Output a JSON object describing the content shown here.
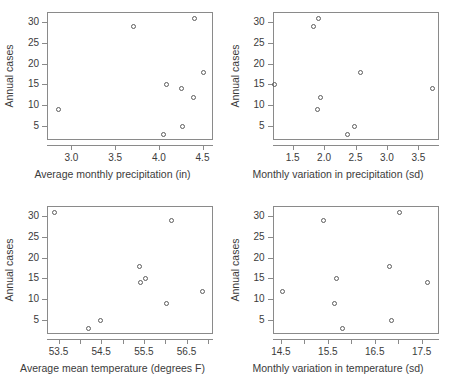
{
  "figure": {
    "ylabel": "Annual cases",
    "n_panels": 4,
    "marker": "open-circle",
    "marker_color": "#5c5c5c",
    "frame_color": "#8a8a8a",
    "background": "#ffffff"
  },
  "chart_data": [
    {
      "type": "scatter",
      "title": "",
      "xlabel": "Average monthly precipitation (in)",
      "ylabel": "Annual cases",
      "xlim": [
        2.72,
        4.62
      ],
      "ylim": [
        1.6,
        32.4
      ],
      "xticks": [
        3.0,
        3.5,
        4.0,
        4.5
      ],
      "xticklabels": [
        "3.0",
        "3.5",
        "4.0",
        "4.5"
      ],
      "yticks": [
        5,
        10,
        15,
        20,
        25,
        30
      ],
      "yticklabels": [
        "5",
        "10",
        "15",
        "20",
        "25",
        "30"
      ],
      "grid": false,
      "legend": "none",
      "x": [
        2.85,
        3.7,
        4.05,
        4.08,
        4.25,
        4.27,
        4.39,
        4.4,
        4.5
      ],
      "y": [
        9,
        29,
        3,
        15,
        14,
        5,
        12,
        31,
        18
      ]
    },
    {
      "type": "scatter",
      "title": "",
      "xlabel": "Monthly variation in precipitation (sd)",
      "ylabel": "Annual cases",
      "xlim": [
        1.18,
        3.82
      ],
      "ylim": [
        1.6,
        32.4
      ],
      "xticks": [
        1.5,
        2.0,
        2.5,
        3.0,
        3.5
      ],
      "xticklabels": [
        "1.5",
        "2.0",
        "2.5",
        "3.0",
        "3.5"
      ],
      "yticks": [
        5,
        10,
        15,
        20,
        25,
        30
      ],
      "yticklabels": [
        "5",
        "10",
        "15",
        "20",
        "25",
        "30"
      ],
      "grid": false,
      "legend": "none",
      "x": [
        1.21,
        1.83,
        1.88,
        1.9,
        1.93,
        2.37,
        2.47,
        2.57,
        3.71
      ],
      "y": [
        15,
        29,
        9,
        31,
        12,
        3,
        5,
        18,
        14
      ]
    },
    {
      "type": "scatter",
      "title": "",
      "xlabel": "Average mean temperature (degrees F)",
      "ylabel": "Annual cases",
      "xlim": [
        53.23,
        57.12
      ],
      "ylim": [
        1.6,
        32.4
      ],
      "xticks": [
        53.5,
        54.5,
        55.5,
        56.5
      ],
      "xticklabels": [
        "53.5",
        "54.5",
        "55.5",
        "56.5"
      ],
      "xminorticks": [
        54.0,
        55.0,
        56.0,
        57.0
      ],
      "yticks": [
        5,
        10,
        15,
        20,
        25,
        30
      ],
      "yticklabels": [
        "5",
        "10",
        "15",
        "20",
        "25",
        "30"
      ],
      "grid": false,
      "legend": "none",
      "x": [
        53.4,
        54.18,
        54.47,
        55.38,
        55.42,
        55.52,
        56.02,
        56.13,
        56.87
      ],
      "y": [
        31,
        3,
        5,
        18,
        14,
        15,
        9,
        29,
        12
      ]
    },
    {
      "type": "scatter",
      "title": "",
      "xlabel": "Monthly variation in temperature (sd)",
      "ylabel": "Annual cases",
      "xlim": [
        14.32,
        17.86
      ],
      "ylim": [
        1.6,
        32.4
      ],
      "xticks": [
        14.5,
        15.5,
        16.5,
        17.5
      ],
      "xticklabels": [
        "14.5",
        "15.5",
        "16.5",
        "17.5"
      ],
      "xminorticks": [
        15.0,
        16.0,
        17.0
      ],
      "yticks": [
        5,
        10,
        15,
        20,
        25,
        30
      ],
      "yticklabels": [
        "5",
        "10",
        "15",
        "20",
        "25",
        "30"
      ],
      "grid": false,
      "legend": "none",
      "x": [
        14.52,
        15.4,
        15.63,
        15.67,
        15.8,
        16.8,
        16.85,
        17.02,
        17.62
      ],
      "y": [
        12,
        29,
        9,
        15,
        3,
        18,
        5,
        31,
        14
      ]
    }
  ]
}
